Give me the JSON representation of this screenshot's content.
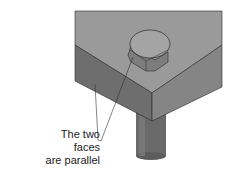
{
  "diagram": {
    "callout": {
      "line1": "The two faces",
      "line2": "are parallel"
    },
    "colors": {
      "top_face": "#9a9a9a",
      "left_face": "#6e6e6e",
      "right_face": "#858585",
      "bolt_head_top": "#a4a4a4",
      "bolt_head_side": "#7d7d7d",
      "shaft": "#6a6a6a",
      "edge": "#2a2a2a"
    }
  }
}
